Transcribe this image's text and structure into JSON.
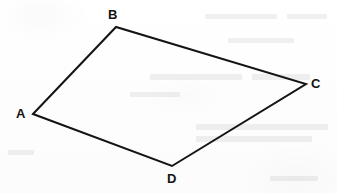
{
  "figure": {
    "kind": "geometry-diagram",
    "shape_name": "quadrilateral",
    "canvas": {
      "width": 337,
      "height": 193
    },
    "background_color": "#fefefe",
    "stroke_color": "#141414",
    "stroke_width": 2,
    "label_color": "#131313",
    "vertices": [
      {
        "id": "A",
        "label": "A",
        "x": 33,
        "y": 114,
        "label_x": 16,
        "label_y": 107
      },
      {
        "id": "B",
        "label": "B",
        "x": 116,
        "y": 27,
        "label_x": 108,
        "label_y": 8
      },
      {
        "id": "C",
        "label": "C",
        "x": 306,
        "y": 84,
        "label_x": 311,
        "label_y": 77
      },
      {
        "id": "D",
        "label": "D",
        "x": 172,
        "y": 166,
        "label_x": 167,
        "label_y": 172
      }
    ],
    "edges": [
      {
        "id": "AB",
        "from": "A",
        "to": "B"
      },
      {
        "id": "BC",
        "from": "B",
        "to": "C"
      },
      {
        "id": "CD",
        "from": "C",
        "to": "D"
      },
      {
        "id": "DA",
        "from": "D",
        "to": "A"
      }
    ],
    "polygon_points": "33,114 116,27 306,84 172,166",
    "bleed_through_marks": [
      {
        "x": 205,
        "y": 14,
        "w": 72,
        "h": 5
      },
      {
        "x": 287,
        "y": 14,
        "w": 40,
        "h": 5
      },
      {
        "x": 228,
        "y": 38,
        "w": 66,
        "h": 5
      },
      {
        "x": 150,
        "y": 74,
        "w": 92,
        "h": 6
      },
      {
        "x": 252,
        "y": 74,
        "w": 58,
        "h": 6
      },
      {
        "x": 130,
        "y": 92,
        "w": 50,
        "h": 5
      },
      {
        "x": 196,
        "y": 124,
        "w": 132,
        "h": 6
      },
      {
        "x": 196,
        "y": 136,
        "w": 116,
        "h": 6
      },
      {
        "x": 8,
        "y": 150,
        "w": 26,
        "h": 5
      },
      {
        "x": 270,
        "y": 176,
        "w": 48,
        "h": 5
      }
    ]
  }
}
